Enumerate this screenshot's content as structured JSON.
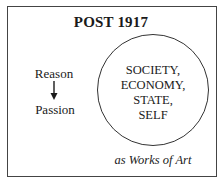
{
  "title": "POST 1917",
  "left_flow": {
    "from": "Reason",
    "to": "Passion",
    "arrow": "down-arrow-icon"
  },
  "circle": {
    "lines": [
      "SOCIETY,",
      "ECONOMY,",
      "STATE,",
      "SELF"
    ]
  },
  "caption": "as Works of Art"
}
